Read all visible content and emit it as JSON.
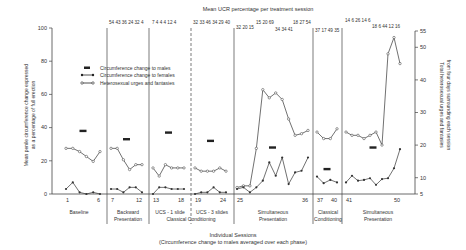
{
  "chart_data": {
    "type": "line",
    "title": "Mean UCR percentage per treatment session",
    "xlabel": "Individual Sessions",
    "xlabel_sub": "(Circumference change to males averaged over each phase)",
    "ylabel_left": "Mean penile circumference change expressed as a percentage of full erection",
    "ylabel_right": "Total heterosexual urges and fantasies from four days surrounding each session",
    "ylim_left": [
      0,
      100
    ],
    "yticks_left": [
      0,
      20,
      40,
      60,
      80,
      100
    ],
    "ylim_right": [
      5,
      55
    ],
    "yticks_right": [
      5,
      10,
      20,
      30,
      40,
      50,
      55
    ],
    "x_tick_labels": [
      "1",
      "6",
      "7",
      "12",
      "13",
      "18",
      "19",
      "24",
      "25",
      "36",
      "37",
      "40",
      "41",
      "50"
    ],
    "legend": [
      {
        "label": "Circumference change to males",
        "style": "bar"
      },
      {
        "label": "Circumference change to females",
        "style": "filled-dot-line"
      },
      {
        "label": "Heterosexual urges and fantasies",
        "style": "open-dot-line"
      }
    ],
    "phases": [
      {
        "name": "Baseline",
        "sessions": [
          1,
          6
        ],
        "ucr": "",
        "males_mean": 38,
        "females": [
          3,
          7,
          1,
          0,
          1,
          0
        ],
        "urges": [
          19,
          19,
          18,
          16.5,
          15,
          18
        ]
      },
      {
        "name": "Backward Presentation",
        "sessions": [
          7,
          12
        ],
        "ucr": "54 43 36 24 32 4",
        "males_mean": 33,
        "females": [
          3,
          3,
          1,
          4,
          4,
          1
        ],
        "urges": [
          19,
          19,
          15.5,
          12.5,
          14,
          14
        ]
      },
      {
        "name": "UCS - 1 slide",
        "sessions": [
          13,
          18
        ],
        "ucr": "7 4 4 4 12 4",
        "males_mean": 37,
        "females": [
          0,
          4,
          4,
          3,
          3,
          3
        ],
        "urges": [
          13,
          10.5,
          14,
          13,
          13,
          13
        ]
      },
      {
        "name": "UCS - 3 slides",
        "sessions": [
          19,
          24
        ],
        "ucr": "32 33 46 34 29 40",
        "males_mean": 32,
        "females": [
          0,
          1,
          1,
          4,
          1,
          1
        ],
        "urges": [
          13,
          12,
          12,
          12,
          13,
          12
        ]
      },
      {
        "name": "Simultaneous Presentation",
        "sessions": [
          25,
          36
        ],
        "ucr": "32 20 15 15 20 69 34 34 41 18 27 54",
        "males_mean": 28,
        "females": [
          3,
          4,
          1,
          4,
          8,
          19,
          11,
          22,
          6,
          13,
          14,
          22
        ],
        "urges": [
          7,
          7.5,
          7.5,
          19,
          37,
          34.5,
          36,
          34,
          28,
          23,
          23.5,
          24.5
        ]
      },
      {
        "name": "Classical Conditioning",
        "sessions": [
          37,
          40
        ],
        "ucr": "37 17 49 35",
        "males_mean": 15,
        "females": [
          10.5,
          6.5,
          8.5,
          7
        ],
        "urges": [
          24,
          22,
          22,
          25
        ]
      },
      {
        "name": "Simultaneous Presentation",
        "sessions": [
          41,
          50
        ],
        "ucr": "14 6 26 14 6 18 6 44 12 16",
        "males_mean": 28,
        "females": [
          7,
          11,
          8,
          8.5,
          9.5,
          5.5,
          9,
          9.5,
          15.5,
          27
        ],
        "urges": [
          24,
          23,
          23,
          22,
          23,
          24,
          20,
          48,
          53,
          45
        ]
      }
    ],
    "group_label": "Classical Conditioning",
    "grid": false,
    "legend_position": "upper-left"
  },
  "labels": {
    "title": "Mean UCR percentage per treatment session",
    "xlabel": "Individual Sessions",
    "xlabel_sub": "(Circumference change to males averaged over each phase)",
    "ylabel_left_1": "Mean penile circumference change expressed",
    "ylabel_left_2": "as a percentage of full erection",
    "ylabel_right_1": "Total heterosexual urges and fantasies",
    "ylabel_right_2": "from four days surrounding each session",
    "legend_males": "Circumference change to males",
    "legend_females": "Circumference change to females",
    "legend_urges": "Heterosexual urges and fantasies",
    "phase_baseline": "Baseline",
    "phase_backward_1": "Backward",
    "phase_backward_2": "Presentation",
    "phase_ucs1": "UCS - 1 slide",
    "phase_ucs3": "UCS - 3 slides",
    "phase_classical_group": "Classical Conditioning",
    "phase_sim1_1": "Simultaneous",
    "phase_sim1_2": "Presentation",
    "phase_cc_1": "Classical",
    "phase_cc_2": "Conditioning",
    "phase_sim2_1": "Simultaneous",
    "phase_sim2_2": "Presentation",
    "ucr_backward": "54 43 36 24 32 4",
    "ucr_ucs1": "7  4  4  4 12  4",
    "ucr_ucs3": "32 33 46 34 29 40",
    "ucr_sim1_a": "32 20 15",
    "ucr_sim1_b": "15 20 69",
    "ucr_sim1_c": "34 34 41",
    "ucr_sim1_d": "18 27 54",
    "ucr_cc": "37 17 49 35",
    "ucr_sim2_a": "14 6 26 14 6",
    "ucr_sim2_b": "18 6 44 12 16"
  }
}
